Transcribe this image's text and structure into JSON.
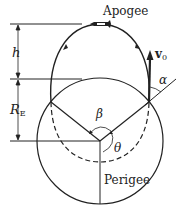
{
  "labels": {
    "apogee": "Apogee",
    "perigee": "Perigee",
    "h": "h",
    "re_main": "R",
    "re_sub": "E",
    "v_main": "v",
    "v_sub": "0",
    "alpha": "α",
    "beta": "β",
    "theta": "θ"
  },
  "colors": {
    "stroke": "#222222",
    "background": "#ffffff"
  }
}
